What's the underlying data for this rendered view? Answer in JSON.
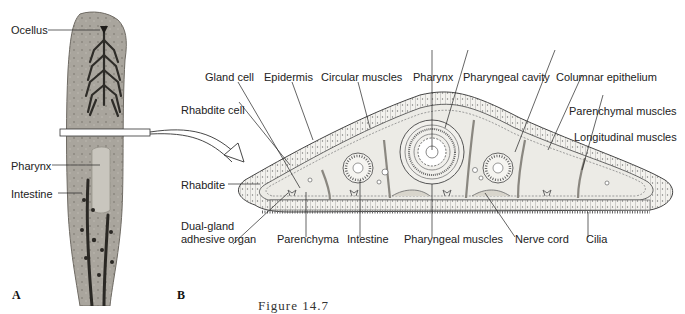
{
  "figure": {
    "caption": "Figure 14.7",
    "panels": [
      {
        "letter": "A",
        "description": "Photograph of planarian flatworm (whole body, dorsal view)"
      },
      {
        "letter": "B",
        "description": "Cross section of planarian through pharynx region"
      }
    ]
  },
  "panel_a": {
    "letter": "A",
    "labels": {
      "ocellus": "Ocellus",
      "pharynx": "Pharynx",
      "intestine": "Intestine"
    }
  },
  "panel_b": {
    "letter": "B",
    "labels": {
      "gland_cell": "Gland cell",
      "epidermis": "Epidermis",
      "circular_muscles": "Circular muscles",
      "pharynx": "Pharynx",
      "pharyngeal_cavity": "Pharyngeal cavity",
      "columnar_epithelium": "Columnar epithelium",
      "rhabdite_cell": "Rhabdite cell",
      "parenchymal_muscles": "Parenchymal muscles",
      "longitudinal_muscles": "Longitudinal muscles",
      "rhabdite": "Rhabdite",
      "dual_gland_line1": "Dual-gland",
      "dual_gland_line2": "adhesive organ",
      "parenchyma": "Parenchyma",
      "intestine": "Intestine",
      "pharyngeal_muscles": "Pharyngeal muscles",
      "nerve_cord": "Nerve cord",
      "cilia": "Cilia"
    }
  },
  "colors": {
    "body_fill": "#ecebe6",
    "outline": "#4a4a4a",
    "worm_fill": "#9c9890",
    "worm_dark": "#2e2c28"
  }
}
